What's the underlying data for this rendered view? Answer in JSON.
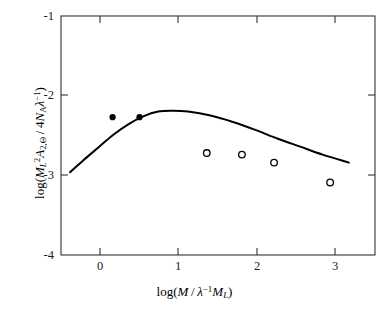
{
  "chart_data": {
    "type": "scatter",
    "title": "",
    "xlabel": "log(M / λ⁻¹M_L)",
    "ylabel": "log(M_L²A_2,Θ / 4N_Aλ⁻¹)",
    "xlim": [
      -0.6,
      3.6
    ],
    "ylim": [
      -4,
      -1
    ],
    "xticks": [
      0,
      1,
      2,
      3
    ],
    "xtick_labels": [
      "0",
      "1",
      "2",
      "3"
    ],
    "yticks": [
      -1,
      -2,
      -3,
      -4
    ],
    "ytick_labels": [
      "-1",
      "-2",
      "-3",
      "-4"
    ],
    "grid": false,
    "legend": "none",
    "series": [
      {
        "name": "filled-circles",
        "marker": "filled-circle",
        "color": "#000000",
        "points": [
          {
            "x": 0.09,
            "y": -2.27
          },
          {
            "x": 0.45,
            "y": -2.27
          }
        ]
      },
      {
        "name": "open-circles",
        "marker": "open-circle",
        "color": "#000000",
        "points": [
          {
            "x": 1.35,
            "y": -2.72
          },
          {
            "x": 1.82,
            "y": -2.74
          },
          {
            "x": 2.25,
            "y": -2.84
          },
          {
            "x": 3.0,
            "y": -3.09
          }
        ]
      },
      {
        "name": "theory-curve",
        "marker": "line",
        "color": "#000000",
        "points": [
          {
            "x": -0.48,
            "y": -2.96
          },
          {
            "x": -0.3,
            "y": -2.81
          },
          {
            "x": -0.1,
            "y": -2.65
          },
          {
            "x": 0.1,
            "y": -2.49
          },
          {
            "x": 0.3,
            "y": -2.36
          },
          {
            "x": 0.5,
            "y": -2.26
          },
          {
            "x": 0.7,
            "y": -2.2
          },
          {
            "x": 0.9,
            "y": -2.19
          },
          {
            "x": 1.1,
            "y": -2.2
          },
          {
            "x": 1.4,
            "y": -2.25
          },
          {
            "x": 1.7,
            "y": -2.33
          },
          {
            "x": 2.0,
            "y": -2.43
          },
          {
            "x": 2.3,
            "y": -2.54
          },
          {
            "x": 2.6,
            "y": -2.64
          },
          {
            "x": 2.9,
            "y": -2.74
          },
          {
            "x": 3.25,
            "y": -2.84
          }
        ]
      }
    ]
  },
  "axes": {
    "x_tick_labels": [
      "0",
      "1",
      "2",
      "3"
    ],
    "y_tick_labels": [
      "-1",
      "-2",
      "-3",
      "-4"
    ]
  }
}
